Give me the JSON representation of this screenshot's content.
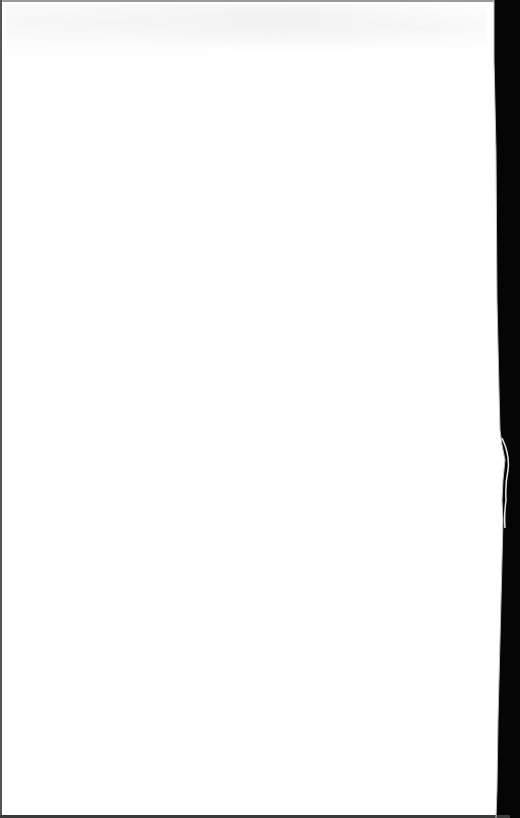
{
  "document": {
    "type": "scanned-page",
    "content_text": "",
    "colors": {
      "paper": "#ffffff",
      "scanner_background": "#050505",
      "edge_shadow": "#8a8a8a"
    }
  }
}
